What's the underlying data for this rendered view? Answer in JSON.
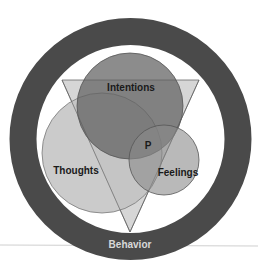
{
  "diagram": {
    "type": "venn-with-triangle-and-ring",
    "outer_ring": {
      "label": "Behavior",
      "color": "#4a4a4a",
      "label_color": "#d8d8d8"
    },
    "triangle": {
      "color": "#c4c4c4"
    },
    "circles": [
      {
        "id": "intentions",
        "label": "Intentions",
        "color": "#6e6e6e"
      },
      {
        "id": "thoughts",
        "label": "Thoughts",
        "color": "#bdbdbd"
      },
      {
        "id": "feelings",
        "label": "Feelings",
        "color": "#8e8e8e"
      }
    ],
    "center_label": "P"
  }
}
